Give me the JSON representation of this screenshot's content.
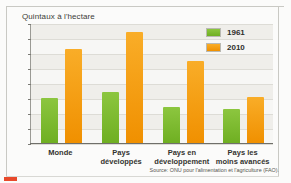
{
  "chart_data": {
    "type": "bar",
    "title": "Quintaux à l'hectare",
    "xlabel": "",
    "ylabel": "Quintaux à l'hectare",
    "ylim": [
      0,
      40
    ],
    "yticks": [
      0,
      5,
      10,
      15,
      20,
      25,
      30,
      35,
      40
    ],
    "grid": true,
    "legend_position": "top-right",
    "categories": [
      "Monde",
      "Pays\ndéveloppés",
      "Pays en\ndéveloppement",
      "Pays les\nmoins avancés"
    ],
    "series": [
      {
        "name": "1961",
        "color": "#7cb82f",
        "values": [
          15,
          17,
          12,
          11.5
        ]
      },
      {
        "name": "2010",
        "color": "#f5a01e",
        "values": [
          31.5,
          37,
          27.5,
          15.5
        ]
      }
    ],
    "source": "Source: ONU pour l'alimentation et l'agriculture (FAO)."
  },
  "colors": {
    "series_1961": "#7cb82f",
    "series_2010": "#f5a01e",
    "plot_background": "#f7f7f5",
    "gridline": "#dddcd6",
    "axis": "#6f6f6a",
    "accent_mark": "#e8492b"
  }
}
